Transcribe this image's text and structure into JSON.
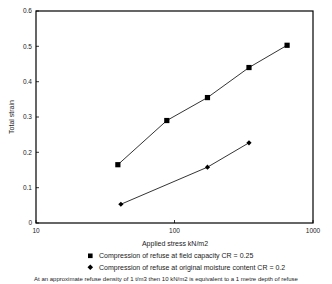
{
  "chart_data": {
    "type": "line",
    "title": "",
    "xlabel": "Applied stress  kN/m2",
    "ylabel": "Total strain",
    "xscale": "log",
    "yscale": "linear",
    "xlim": [
      10,
      1000
    ],
    "ylim": [
      0,
      0.6
    ],
    "xticks": [
      10,
      100,
      1000
    ],
    "xtick_labels": [
      "10",
      "100",
      "1000"
    ],
    "yticks": [
      0,
      0.1,
      0.2,
      0.3,
      0.4,
      0.5,
      0.6
    ],
    "ytick_labels": [
      "0",
      "0.1",
      "0.2",
      "0.3",
      "0.4",
      "0.5",
      "0.6"
    ],
    "grid": false,
    "legend_position": "below",
    "series": [
      {
        "name": "Compression of refuse at field capacity  CR = 0.25",
        "marker": "square",
        "color": "#000000",
        "x": [
          39,
          88,
          173,
          345,
          650
        ],
        "y": [
          0.165,
          0.29,
          0.355,
          0.44,
          0.503
        ]
      },
      {
        "name": "Compression of refuse at original moisture content  CR = 0.2",
        "marker": "diamond",
        "color": "#000000",
        "x": [
          41,
          173,
          345
        ],
        "y": [
          0.053,
          0.158,
          0.227
        ]
      }
    ],
    "caption": "At an approximate refuse density of 1 t/m3 then 10 kN/m2 is equivalent to a 1 metre depth of refuse"
  },
  "axis": {
    "x_title": "Applied stress  kN/m2",
    "y_title": "Total strain",
    "x_tick_labels": [
      "10",
      "100",
      "1000"
    ],
    "y_tick_labels": [
      "0.6",
      "0.5",
      "0.4",
      "0.3",
      "0.2",
      "0.1",
      "0"
    ]
  },
  "legend": {
    "entries": [
      {
        "marker": "square-marker-icon",
        "label": "Compression of refuse at field capacity  CR = 0.25"
      },
      {
        "marker": "diamond-marker-icon",
        "label": "Compression of refuse at original moisture content  CR = 0.2"
      }
    ]
  },
  "footnote": {
    "text": "At an approximate refuse density of 1 t/m3 then 10 kN/m2 is equivalent to a 1 metre depth of refuse"
  }
}
